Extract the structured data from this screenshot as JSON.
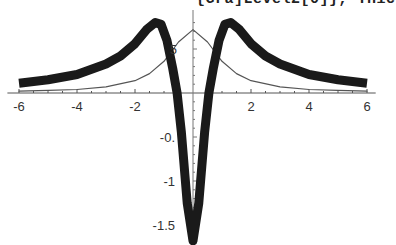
{
  "caption": "{Gra]Level2[0]}, Thic",
  "chart_data": {
    "type": "line",
    "title": "",
    "xlabel": "",
    "ylabel": "",
    "xlim": [
      -6,
      6
    ],
    "ylim": [
      -1.7,
      0.8
    ],
    "grid": false,
    "legend": null,
    "x_ticks": [
      -6,
      -4,
      -2,
      2,
      4,
      6
    ],
    "x_tick_labels": [
      "-6",
      "-4",
      "-2",
      "2",
      "4",
      "6"
    ],
    "y_ticks": [
      0.5,
      -0.5,
      -1,
      -1.5
    ],
    "y_tick_labels": [
      "5",
      "-0.",
      "-1",
      "-1.5"
    ],
    "series": [
      {
        "name": "thin curve (Lorentzian)",
        "style": "thin",
        "color": "#555555",
        "x": [
          -6,
          -5,
          -4,
          -3,
          -2,
          -1.5,
          -1,
          -0.5,
          0,
          0.5,
          1,
          1.5,
          2,
          3,
          4,
          5,
          6
        ],
        "y": [
          0.02,
          0.03,
          0.04,
          0.07,
          0.14,
          0.22,
          0.36,
          0.58,
          0.72,
          0.58,
          0.36,
          0.22,
          0.14,
          0.07,
          0.04,
          0.03,
          0.02
        ]
      },
      {
        "name": "thick curve",
        "style": "thick",
        "color": "#1a1a1a",
        "x": [
          -6,
          -5,
          -4,
          -3,
          -2.5,
          -2,
          -1.6,
          -1.3,
          -1.1,
          -0.9,
          -0.7,
          -0.55,
          -0.4,
          -0.2,
          0,
          0.2,
          0.4,
          0.55,
          0.7,
          0.9,
          1.1,
          1.3,
          1.6,
          2,
          2.5,
          3,
          4,
          5,
          6
        ],
        "y": [
          0.11,
          0.15,
          0.21,
          0.33,
          0.42,
          0.56,
          0.72,
          0.8,
          0.78,
          0.6,
          0.28,
          0.0,
          -0.45,
          -1.25,
          -1.68,
          -1.25,
          -0.45,
          0.0,
          0.28,
          0.6,
          0.78,
          0.8,
          0.72,
          0.56,
          0.42,
          0.33,
          0.21,
          0.15,
          0.11
        ]
      }
    ]
  }
}
